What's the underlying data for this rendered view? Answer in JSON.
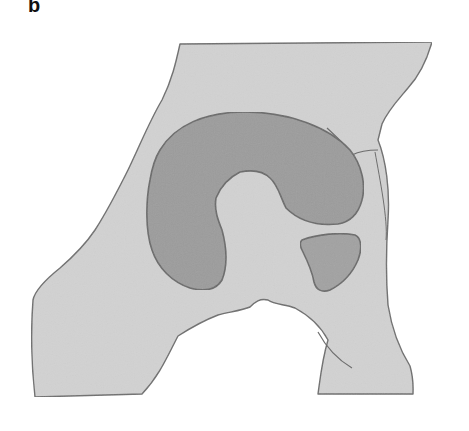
{
  "figure": {
    "panel_label": "b",
    "colors": {
      "background": "#ffffff",
      "outer_region_fill": "#d2d2d2",
      "outer_region_stroke": "#6e6e6e",
      "c_shape_fill": "#9c9c9c",
      "small_shape_fill": "#a2a2a2",
      "inner_stroke": "#6a6a6a"
    }
  }
}
